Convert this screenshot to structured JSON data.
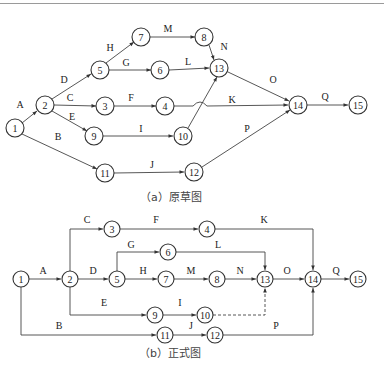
{
  "captions": {
    "draft": "（a）原草图",
    "formal": "（b）正式图"
  },
  "diagram_a": {
    "title": "原草图",
    "nodes": [
      {
        "id": "1",
        "x": 15,
        "y": 128
      },
      {
        "id": "2",
        "x": 45,
        "y": 105
      },
      {
        "id": "3",
        "x": 105,
        "y": 106
      },
      {
        "id": "4",
        "x": 165,
        "y": 106
      },
      {
        "id": "5",
        "x": 100,
        "y": 70
      },
      {
        "id": "6",
        "x": 160,
        "y": 70
      },
      {
        "id": "7",
        "x": 141,
        "y": 37
      },
      {
        "id": "8",
        "x": 204,
        "y": 37
      },
      {
        "id": "9",
        "x": 94,
        "y": 136
      },
      {
        "id": "10",
        "x": 183,
        "y": 136
      },
      {
        "id": "11",
        "x": 105,
        "y": 173
      },
      {
        "id": "12",
        "x": 194,
        "y": 172
      },
      {
        "id": "13",
        "x": 219,
        "y": 68
      },
      {
        "id": "14",
        "x": 298,
        "y": 105
      },
      {
        "id": "15",
        "x": 358,
        "y": 105
      }
    ],
    "edges": [
      {
        "label": "A",
        "from": "1",
        "to": "2",
        "lx": 20,
        "ly": 108
      },
      {
        "label": "B",
        "from": "1",
        "to": "11",
        "lx": 58,
        "ly": 140
      },
      {
        "label": "C",
        "from": "2",
        "to": "3",
        "lx": 70,
        "ly": 101
      },
      {
        "label": "D",
        "from": "2",
        "to": "5",
        "lx": 64,
        "ly": 83
      },
      {
        "label": "E",
        "from": "2",
        "to": "9",
        "lx": 72,
        "ly": 120
      },
      {
        "label": "F",
        "from": "3",
        "to": "4",
        "lx": 131,
        "ly": 101
      },
      {
        "label": "G",
        "from": "5",
        "to": "6",
        "lx": 126,
        "ly": 66
      },
      {
        "label": "H",
        "from": "5",
        "to": "7",
        "lx": 110,
        "ly": 51
      },
      {
        "label": "I",
        "from": "9",
        "to": "10",
        "lx": 141,
        "ly": 132
      },
      {
        "label": "J",
        "from": "11",
        "to": "12",
        "lx": 152,
        "ly": 168
      },
      {
        "label": "K",
        "from": "4",
        "to": "14",
        "lx": 232,
        "ly": 103
      },
      {
        "label": "L",
        "from": "6",
        "to": "13",
        "lx": 188,
        "ly": 65
      },
      {
        "label": "M",
        "from": "7",
        "to": "8",
        "lx": 168,
        "ly": 32
      },
      {
        "label": "N",
        "from": "8",
        "to": "13",
        "lx": 224,
        "ly": 50
      },
      {
        "label": "O",
        "from": "13",
        "to": "14",
        "lx": 273,
        "ly": 83
      },
      {
        "label": "P",
        "from": "12",
        "to": "14",
        "lx": 247,
        "ly": 132
      },
      {
        "label": "Q",
        "from": "14",
        "to": "15",
        "lx": 325,
        "ly": 100
      },
      {
        "label": "",
        "from": "10",
        "to": "13",
        "lx": 0,
        "ly": 0
      }
    ]
  },
  "diagram_b": {
    "title": "正式图",
    "nodes": [
      {
        "id": "1",
        "x": 21,
        "y": 279
      },
      {
        "id": "2",
        "x": 70,
        "y": 279
      },
      {
        "id": "3",
        "x": 112,
        "y": 229
      },
      {
        "id": "4",
        "x": 207,
        "y": 229
      },
      {
        "id": "5",
        "x": 117,
        "y": 279
      },
      {
        "id": "6",
        "x": 168,
        "y": 252
      },
      {
        "id": "7",
        "x": 166,
        "y": 279
      },
      {
        "id": "8",
        "x": 217,
        "y": 279
      },
      {
        "id": "9",
        "x": 155,
        "y": 315
      },
      {
        "id": "10",
        "x": 205,
        "y": 315
      },
      {
        "id": "11",
        "x": 165,
        "y": 335
      },
      {
        "id": "12",
        "x": 215,
        "y": 335
      },
      {
        "id": "13",
        "x": 265,
        "y": 279
      },
      {
        "id": "14",
        "x": 313,
        "y": 279
      },
      {
        "id": "15",
        "x": 358,
        "y": 279
      }
    ],
    "edges": [
      {
        "label": "A",
        "lx": 43,
        "ly": 274
      },
      {
        "label": "B",
        "lx": 59,
        "ly": 329
      },
      {
        "label": "C",
        "lx": 87,
        "ly": 223
      },
      {
        "label": "D",
        "lx": 93,
        "ly": 274
      },
      {
        "label": "E",
        "lx": 104,
        "ly": 306
      },
      {
        "label": "F",
        "lx": 156,
        "ly": 223
      },
      {
        "label": "G",
        "lx": 131,
        "ly": 248
      },
      {
        "label": "H",
        "lx": 143,
        "ly": 274
      },
      {
        "label": "I",
        "lx": 180,
        "ly": 306
      },
      {
        "label": "J",
        "lx": 191,
        "ly": 329
      },
      {
        "label": "K",
        "lx": 264,
        "ly": 223
      },
      {
        "label": "L",
        "lx": 218,
        "ly": 248
      },
      {
        "label": "M",
        "lx": 191,
        "ly": 274
      },
      {
        "label": "N",
        "lx": 240,
        "ly": 274
      },
      {
        "label": "O",
        "lx": 287,
        "ly": 274
      },
      {
        "label": "P",
        "lx": 276,
        "ly": 329
      },
      {
        "label": "Q",
        "lx": 336,
        "ly": 274
      }
    ]
  }
}
